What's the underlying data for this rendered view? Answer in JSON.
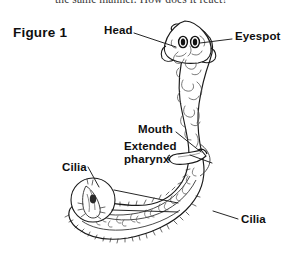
{
  "page": {
    "width": 297,
    "height": 256,
    "background": "#ffffff",
    "ink": "#111111"
  },
  "cropped_body_text": "the same manner. How does it react?",
  "figure": {
    "title": "Figure 1"
  },
  "labels": [
    {
      "id": "head",
      "text": "Head",
      "x": 104,
      "y": 24,
      "lines": 1
    },
    {
      "id": "eyespot",
      "text": "Eyespot",
      "x": 235,
      "y": 30,
      "lines": 1
    },
    {
      "id": "mouth",
      "text": "Mouth",
      "x": 138,
      "y": 123,
      "lines": 1
    },
    {
      "id": "pharynx",
      "text": "Extended pharynx",
      "x": 124,
      "y": 140,
      "lines": 2
    },
    {
      "id": "cilia_left",
      "text": "Cilia",
      "x": 62,
      "y": 161,
      "lines": 1
    },
    {
      "id": "cilia_right",
      "text": "Cilia",
      "x": 241,
      "y": 213,
      "lines": 1
    }
  ],
  "leader_lines": [
    {
      "id": "head-leader",
      "from": [
        134,
        33
      ],
      "to": [
        176,
        47
      ]
    },
    {
      "id": "eyespot-leader",
      "from": [
        232,
        39
      ],
      "to": [
        199,
        43
      ]
    },
    {
      "id": "mouth-leader",
      "from": [
        176,
        132
      ],
      "to": [
        200,
        153
      ]
    },
    {
      "id": "pharynx-leader",
      "from": [
        190,
        155
      ],
      "to": [
        212,
        164
      ]
    },
    {
      "id": "cilia-left-leader",
      "from": [
        88,
        167
      ],
      "to": [
        98,
        186
      ]
    },
    {
      "id": "cilia-right-leader",
      "from": [
        238,
        219
      ],
      "to": [
        214,
        212
      ]
    },
    {
      "id": "inset-callout-top",
      "from": [
        113,
        191
      ],
      "to": [
        178,
        203
      ]
    },
    {
      "id": "inset-callout-bot",
      "from": [
        112,
        207
      ],
      "to": [
        178,
        210
      ]
    }
  ],
  "anatomy_parts": [
    "head",
    "eyespot-left",
    "eyespot-right",
    "body-trunk",
    "mouth-opening",
    "extended-pharynx",
    "tail",
    "cilia-fringe",
    "cilia-magnification-inset"
  ],
  "inset": {
    "id": "cilia-magnification-inset",
    "center_x": 93,
    "center_y": 200,
    "radius": 22
  }
}
